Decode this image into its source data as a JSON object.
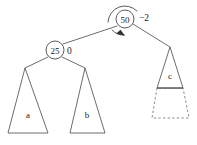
{
  "diagram": {
    "type": "avl-tree-rotation",
    "background_color": "#ffffff",
    "stroke_color": "#6e6e6e",
    "text_color": "#1c1c1c",
    "nodes": [
      {
        "id": "root",
        "key": "50",
        "balance_factor": "−2",
        "cx": 125,
        "cy": 19,
        "r": 9,
        "has_rotation_marker": true
      },
      {
        "id": "left-child",
        "key": "25",
        "balance_factor": "0",
        "cx": 55,
        "cy": 50,
        "r": 9,
        "has_rotation_marker": false
      }
    ],
    "subtrees": [
      {
        "id": "a",
        "label": "a",
        "style": "solid",
        "apex_x": 25,
        "apex_y": 68
      },
      {
        "id": "b",
        "label": "b",
        "style": "solid",
        "apex_x": 85,
        "apex_y": 68
      },
      {
        "id": "c",
        "label": "c",
        "style": "solid-with-dashed-extension",
        "apex_x": 170,
        "apex_y": 47
      }
    ],
    "edges": [
      {
        "from": "root",
        "to": "left-child"
      },
      {
        "from": "root",
        "to": "c"
      },
      {
        "from": "left-child",
        "to": "a"
      },
      {
        "from": "left-child",
        "to": "b"
      }
    ],
    "annotations": {
      "root_balance_label": "−2",
      "left_child_balance_label": "0",
      "rotation_arrow": "counter-clockwise-rotation-arrow"
    }
  }
}
